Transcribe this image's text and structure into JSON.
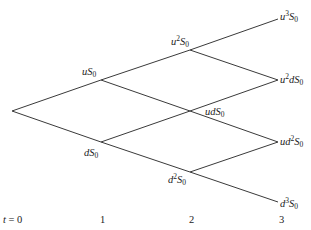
{
  "diagram": {
    "type": "binomial-tree",
    "steps": 3,
    "nodes": [
      {
        "id": "n0",
        "x": 12,
        "y": 111,
        "label": ""
      },
      {
        "id": "u1",
        "x": 101,
        "y": 80,
        "label": "uS0",
        "base": "u",
        "exp": "",
        "mid": "",
        "lx": 82,
        "ly": 75
      },
      {
        "id": "d1",
        "x": 101,
        "y": 142,
        "label": "dS0",
        "base": "d",
        "exp": "",
        "mid": "",
        "lx": 84,
        "ly": 156
      },
      {
        "id": "uu2",
        "x": 190,
        "y": 50,
        "label": "u2S0",
        "base": "u",
        "exp": "2",
        "mid": "",
        "lx": 171,
        "ly": 45
      },
      {
        "id": "ud2",
        "x": 190,
        "y": 111,
        "label": "udS0",
        "base": "ud",
        "exp": "",
        "mid": "",
        "lx": 205,
        "ly": 115
      },
      {
        "id": "dd2",
        "x": 190,
        "y": 172,
        "label": "d2S0",
        "base": "d",
        "exp": "2",
        "mid": "",
        "lx": 168,
        "ly": 183
      },
      {
        "id": "uuu3",
        "x": 278,
        "y": 19,
        "label": "u3S0",
        "base": "u",
        "exp": "3",
        "mid": "",
        "lx": 280,
        "ly": 20
      },
      {
        "id": "uud3",
        "x": 278,
        "y": 80,
        "label": "u2dS0",
        "base": "u",
        "exp": "2",
        "mid": "d",
        "lx": 280,
        "ly": 83
      },
      {
        "id": "udd3",
        "x": 278,
        "y": 142,
        "label": "ud2S0",
        "base": "ud",
        "exp": "2",
        "mid": "",
        "lx": 280,
        "ly": 145
      },
      {
        "id": "ddd3",
        "x": 278,
        "y": 202,
        "label": "d3S0",
        "base": "d",
        "exp": "3",
        "mid": "",
        "lx": 280,
        "ly": 207
      }
    ],
    "edges": [
      [
        "n0",
        "u1"
      ],
      [
        "n0",
        "d1"
      ],
      [
        "u1",
        "uu2"
      ],
      [
        "u1",
        "ud2"
      ],
      [
        "d1",
        "ud2"
      ],
      [
        "d1",
        "dd2"
      ],
      [
        "uu2",
        "uuu3"
      ],
      [
        "uu2",
        "uud3"
      ],
      [
        "ud2",
        "uud3"
      ],
      [
        "ud2",
        "udd3"
      ],
      [
        "dd2",
        "udd3"
      ],
      [
        "dd2",
        "ddd3"
      ]
    ],
    "time_axis": [
      {
        "label": "t = 0",
        "x": 3,
        "y": 223
      },
      {
        "label": "1",
        "x": 100,
        "y": 223
      },
      {
        "label": "2",
        "x": 189,
        "y": 223
      },
      {
        "label": "3",
        "x": 279,
        "y": 223
      }
    ],
    "colors": {
      "edge": "#3a3a3a",
      "text": "#222222",
      "background": "#ffffff"
    }
  }
}
